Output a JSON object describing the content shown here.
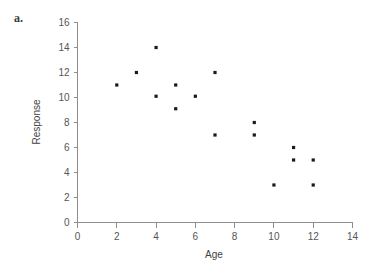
{
  "panel": {
    "label": "a."
  },
  "chart_data": {
    "type": "scatter",
    "title": "",
    "xlabel": "Age",
    "ylabel": "Response",
    "xlim": [
      0,
      14
    ],
    "ylim": [
      0,
      16
    ],
    "xticks": [
      0,
      2,
      4,
      6,
      8,
      10,
      12,
      14
    ],
    "yticks": [
      0,
      2,
      4,
      6,
      8,
      10,
      12,
      14,
      16
    ],
    "xtick_labels": [
      "0",
      "2",
      "4",
      "6",
      "8",
      "10",
      "12",
      "14"
    ],
    "ytick_labels": [
      "0",
      "2",
      "4",
      "6",
      "8",
      "10",
      "12",
      "14",
      "16"
    ],
    "grid": false,
    "legend": false,
    "marker": "square",
    "marker_color": "#1a1a1a",
    "points": [
      {
        "x": 2,
        "y": 11
      },
      {
        "x": 3,
        "y": 12
      },
      {
        "x": 4,
        "y": 14
      },
      {
        "x": 4,
        "y": 10.1
      },
      {
        "x": 5,
        "y": 11
      },
      {
        "x": 5,
        "y": 9.1
      },
      {
        "x": 6,
        "y": 10.1
      },
      {
        "x": 7,
        "y": 12
      },
      {
        "x": 7,
        "y": 7
      },
      {
        "x": 9,
        "y": 8
      },
      {
        "x": 9,
        "y": 7
      },
      {
        "x": 10,
        "y": 3
      },
      {
        "x": 11,
        "y": 6
      },
      {
        "x": 11,
        "y": 5
      },
      {
        "x": 12,
        "y": 5
      },
      {
        "x": 12,
        "y": 3
      }
    ]
  }
}
